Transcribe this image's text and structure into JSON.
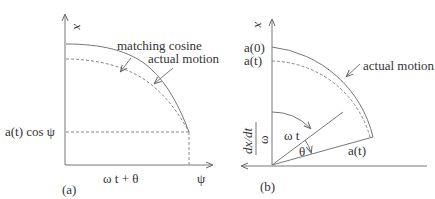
{
  "panel_a": {
    "tag": "(a)",
    "y_axis_label": "x",
    "x_axis_label": "ψ",
    "x_mid_label": "ω t  + θ",
    "y_mark_label": "a(t) cos  ψ",
    "callout_1": "matching cosine",
    "callout_2": "actual motion"
  },
  "panel_b": {
    "tag": "(b)",
    "y_axis_label": "x",
    "top_label_1": "a(0)",
    "top_label_2": "a(t)",
    "callout": "actual motion",
    "angle_1": "ω t",
    "angle_2": "θ",
    "radius_label": "a(t)",
    "x_axis_num": "dx/dt",
    "x_axis_den": "ω"
  }
}
